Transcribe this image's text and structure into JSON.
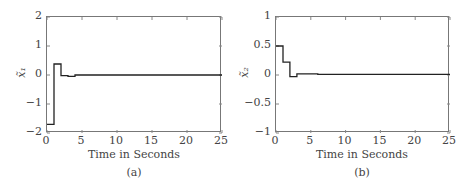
{
  "chart_data": [
    {
      "type": "line",
      "id": "a",
      "caption": "(a)",
      "xlabel": "Time in Seconds",
      "ylabel": "x̃₁",
      "xlim": [
        0,
        25
      ],
      "ylim": [
        -2,
        2
      ],
      "xticks": [
        "0",
        "5",
        "10",
        "15",
        "20",
        "25"
      ],
      "yticks": [
        "2",
        "1",
        "0",
        "−1",
        "−2"
      ],
      "step": true,
      "grid": false,
      "series": [
        {
          "name": "x̃1",
          "x": [
            0,
            1,
            1,
            2,
            2,
            3,
            3,
            4,
            4,
            25
          ],
          "y": [
            -1.7,
            -1.7,
            0.38,
            0.38,
            -0.02,
            -0.02,
            -0.05,
            -0.05,
            0.0,
            0.0
          ]
        }
      ]
    },
    {
      "type": "line",
      "id": "b",
      "caption": "(b)",
      "xlabel": "Time in Seconds",
      "ylabel": "x̃₂",
      "xlim": [
        0,
        25
      ],
      "ylim": [
        -1,
        1
      ],
      "xticks": [
        "0",
        "5",
        "10",
        "15",
        "20",
        "25"
      ],
      "yticks": [
        "1",
        "0.5",
        "0",
        "−0.5",
        "−1"
      ],
      "step": true,
      "grid": false,
      "series": [
        {
          "name": "x̃2",
          "x": [
            0,
            1,
            1,
            2,
            2,
            3,
            3,
            6,
            6,
            25
          ],
          "y": [
            0.5,
            0.5,
            0.22,
            0.22,
            -0.03,
            -0.03,
            0.02,
            0.02,
            0.01,
            0.01
          ]
        }
      ]
    }
  ]
}
